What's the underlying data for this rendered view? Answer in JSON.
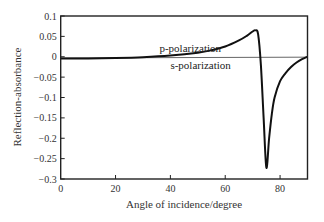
{
  "chart_data": {
    "type": "line",
    "title": "",
    "xlabel": "Angle of incidence/degree",
    "ylabel": "Reflection-absorbance",
    "xlim": [
      0,
      90
    ],
    "ylim": [
      -0.3,
      0.1
    ],
    "grid": false,
    "legend": "none (inline annotations)",
    "x_ticks": [
      0,
      20,
      40,
      60,
      80
    ],
    "x_tick_labels": [
      "0",
      "20",
      "40",
      "60",
      "80"
    ],
    "y_ticks": [
      0.1,
      0.05,
      0,
      -0.05,
      -0.1,
      -0.15,
      -0.2,
      -0.25,
      -0.3
    ],
    "y_tick_labels": [
      "0.1",
      "0.05",
      "0",
      "−0.05",
      "−0.1",
      "−0.15",
      "−0.2",
      "−0.25",
      "−0.3"
    ],
    "series": [
      {
        "name": "p-polarization",
        "color": "#111111",
        "x": [
          0,
          10,
          20,
          30,
          40,
          50,
          55,
          60,
          65,
          68,
          70,
          71,
          72,
          73,
          74,
          75,
          76,
          77,
          78,
          80,
          82,
          84,
          86,
          88,
          90
        ],
        "y": [
          -0.004,
          -0.004,
          -0.003,
          -0.001,
          0.003,
          0.01,
          0.016,
          0.025,
          0.04,
          0.052,
          0.062,
          0.065,
          0.055,
          -0.02,
          -0.15,
          -0.272,
          -0.2,
          -0.14,
          -0.1,
          -0.06,
          -0.04,
          -0.025,
          -0.014,
          -0.006,
          0.0
        ]
      },
      {
        "name": "s-polarization",
        "color": "#555555",
        "x": [
          0,
          90
        ],
        "y": [
          -0.003,
          -0.001
        ]
      }
    ],
    "annotations": [
      {
        "text": "p-polarization",
        "x": 36,
        "y": 0.022
      },
      {
        "text": "s-polarization",
        "x": 40,
        "y": -0.02
      }
    ]
  }
}
